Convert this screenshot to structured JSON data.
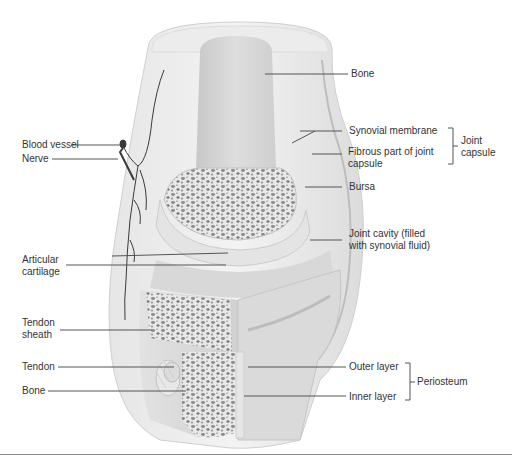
{
  "diagram": {
    "labels_right": {
      "bone_top": "Bone",
      "synovial_membrane": "Synovial membrane",
      "fibrous_capsule_line1": "Fibrous part of joint",
      "fibrous_capsule_line2": "capsule",
      "joint_capsule_line1": "Joint",
      "joint_capsule_line2": "capsule",
      "bursa": "Bursa",
      "joint_cavity_line1": "Joint cavity (filled",
      "joint_cavity_line2": "with synovial fluid)",
      "outer_layer": "Outer layer",
      "inner_layer": "Inner layer",
      "periosteum": "Periosteum"
    },
    "labels_left": {
      "blood_vessel": "Blood vessel",
      "nerve": "Nerve",
      "articular_cartilage_line1": "Articular",
      "articular_cartilage_line2": "cartilage",
      "tendon_sheath_line1": "Tendon",
      "tendon_sheath_line2": "sheath",
      "tendon": "Tendon",
      "bone_bottom": "Bone"
    },
    "colors": {
      "text": "#333333",
      "leader_line": "#555555",
      "tissue_light": "#eeeeee",
      "tissue_mid": "#d4d4d4",
      "tissue_dark": "#b0b0b0",
      "spongy_bone": "#777777",
      "vessel": "#3a3a3a"
    }
  }
}
